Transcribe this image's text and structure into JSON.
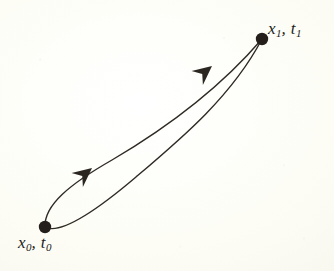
{
  "figure": {
    "kind": "path-integral-paths-diagram",
    "caption_text": "",
    "background_color": "#fdfdf7",
    "ink_color": "#2f2a24",
    "stroke_width_px": 1.4
  },
  "endpoints": [
    {
      "id": "initial-event",
      "label_x": "x",
      "label_x_sub": "0",
      "separator": ", ",
      "label_t": "t",
      "label_t_sub": "0",
      "full_label": "x0, t0",
      "cx": 45,
      "cy": 227,
      "radius": 6.2
    },
    {
      "id": "final-event",
      "label_x": "x",
      "label_x_sub": "1",
      "separator": ", ",
      "label_t": "t",
      "label_t_sub": "1",
      "full_label": "x1, t1",
      "cx": 262,
      "cy": 39,
      "radius": 6.2
    }
  ],
  "paths": [
    {
      "id": "path-upper",
      "d": "M 45 227 C 44 205, 70 184, 112 160 C 158 133, 214 95, 262 39",
      "direction": "initial-to-final"
    },
    {
      "id": "path-lower",
      "d": "M 45 227 C 60 235, 96 211, 136 177 C 182 138, 232 96, 262 39",
      "direction": "initial-to-final"
    }
  ],
  "arrowheads": [
    {
      "id": "arrow-upper-path",
      "tip_x": 212,
      "tip_y": 66,
      "angle_deg": -39,
      "length": 19,
      "half_width": 9
    },
    {
      "id": "arrow-lower-path",
      "tip_x": 92,
      "tip_y": 168,
      "angle_deg": -39,
      "length": 19,
      "half_width": 9
    }
  ],
  "crossing_point": {
    "x": 140,
    "y": 141
  }
}
